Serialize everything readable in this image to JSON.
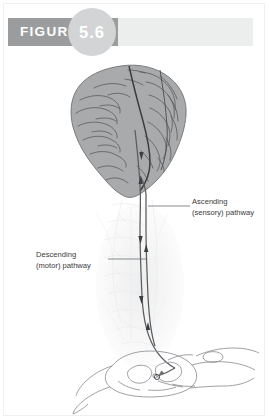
{
  "figure": {
    "word": "FIGURE",
    "number": "5.6",
    "bar_dark_color": "#9b9c9e",
    "bar_light_color": "#eceded",
    "badge_color": "#d3d4d5",
    "word_color": "#ffffff"
  },
  "illustration": {
    "title": "brain-and-spinal-cord-pathways",
    "brain_fill": "#a9aaac",
    "brain_outline": "#6f7173",
    "sulci_color": "#55575a",
    "tract_color": "#5a5c60",
    "ghost_spine_color": "#e2e3e5",
    "cord_outline": "#8e9094",
    "parts": [
      "cerebrum",
      "central-sulcus",
      "brainstem",
      "spinal-cord-tracts",
      "spinal-cord-cross-section",
      "dorsal-root-ganglion",
      "ventral-root"
    ]
  },
  "labels": {
    "ascending": {
      "line1": "Ascending",
      "line2": "(sensory) pathway"
    },
    "descending": {
      "line1": "Descending",
      "line2": "(motor) pathway"
    }
  }
}
